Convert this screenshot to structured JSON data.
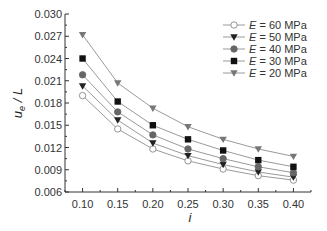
{
  "chart_data": {
    "type": "line",
    "title": "",
    "xlabel": "i",
    "ylabel": "u_e / L",
    "ylabel_main": "u",
    "ylabel_sub": "e",
    "ylabel_tail": " / L",
    "xlim": [
      0.075,
      0.425
    ],
    "ylim": [
      0.006,
      0.03
    ],
    "grid": false,
    "legend_position": "upper right",
    "x": [
      0.1,
      0.15,
      0.2,
      0.25,
      0.3,
      0.35,
      0.4
    ],
    "x_tick_labels": [
      "0.10",
      "0.15",
      "0.20",
      "0.25",
      "0.30",
      "0.35",
      "0.40"
    ],
    "y_ticks": [
      0.006,
      0.009,
      0.012,
      0.015,
      0.018,
      0.021,
      0.024,
      0.027,
      0.03
    ],
    "y_tick_labels": [
      "0.006",
      "0.009",
      "0.012",
      "0.015",
      "0.018",
      "0.021",
      "0.024",
      "0.027",
      "0.030"
    ],
    "series": [
      {
        "name": "E = 60 MPa",
        "var": "E",
        "rest": " = 60 MPa",
        "marker": "circle-open",
        "color": "#888888",
        "fill": "#ffffff",
        "values": [
          0.019,
          0.0145,
          0.0118,
          0.0102,
          0.0091,
          0.0082,
          0.0076
        ]
      },
      {
        "name": "E = 50 MPa",
        "var": "E",
        "rest": " = 50 MPa",
        "marker": "triangle-down",
        "color": "#222222",
        "fill": "#222222",
        "values": [
          0.0203,
          0.0157,
          0.0126,
          0.0109,
          0.0097,
          0.0087,
          0.008
        ]
      },
      {
        "name": "E = 40 MPa",
        "var": "E",
        "rest": " = 40 MPa",
        "marker": "circle",
        "color": "#666666",
        "fill": "#666666",
        "values": [
          0.0218,
          0.0168,
          0.0137,
          0.0118,
          0.0105,
          0.0094,
          0.0086
        ]
      },
      {
        "name": "E = 30 MPa",
        "var": "E",
        "rest": " = 30 MPa",
        "marker": "square",
        "color": "#111111",
        "fill": "#111111",
        "values": [
          0.024,
          0.0182,
          0.015,
          0.0131,
          0.0116,
          0.0103,
          0.0094
        ]
      },
      {
        "name": "E = 20 MPa",
        "var": "E",
        "rest": " = 20 MPa",
        "marker": "triangle-down",
        "color": "#777777",
        "fill": "#777777",
        "values": [
          0.0272,
          0.0207,
          0.0173,
          0.0148,
          0.0131,
          0.0118,
          0.0108
        ]
      }
    ]
  }
}
